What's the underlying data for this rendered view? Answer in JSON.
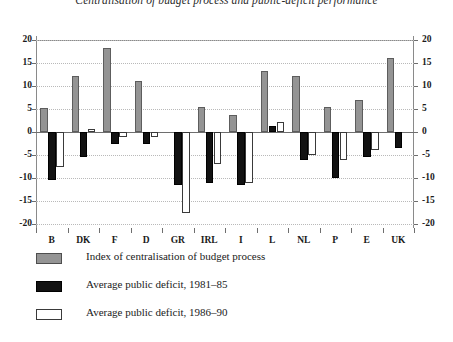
{
  "chart_data": {
    "type": "bar",
    "title": "Centralisation of budget process and public-deficit performance",
    "xlabel": "",
    "ylabel": "",
    "ylim": [
      -20,
      20
    ],
    "yticks": [
      20,
      15,
      10,
      5,
      0,
      -5,
      -10,
      -15,
      -20
    ],
    "ytick_labels": [
      "20",
      "15",
      "10",
      "5",
      "0",
      "-5",
      "-10",
      "-15",
      "-20"
    ],
    "grid": true,
    "dual_y_axis": true,
    "legend_position": "below",
    "categories": [
      "B",
      "DK",
      "F",
      "D",
      "GR",
      "IRL",
      "I",
      "L",
      "NL",
      "P",
      "E",
      "UK"
    ],
    "series": [
      {
        "name": "Index of centralisation of budget process",
        "color": "#949494",
        "values": [
          5.2,
          12.1,
          18.3,
          11.0,
          0.0,
          5.5,
          3.6,
          13.2,
          12.1,
          5.5,
          7.0,
          16.0
        ]
      },
      {
        "name": "Average public deficit, 1981–85",
        "color": "#121212",
        "values": [
          -10.5,
          -5.4,
          -2.6,
          -2.6,
          -11.5,
          -11.0,
          -11.6,
          1.2,
          -6.0,
          -10.0,
          -5.5,
          -3.5
        ]
      },
      {
        "name": "Average public deficit, 1986–90",
        "color": "#ffffff",
        "values": [
          -7.6,
          0.6,
          -1.0,
          -1.0,
          -17.5,
          -7.0,
          -11.0,
          2.2,
          -5.0,
          -6.0,
          -4.0,
          0.0
        ]
      }
    ]
  },
  "axis": {
    "left_labels": [
      "20",
      "15",
      "10",
      "5",
      "0",
      "-5",
      "-10",
      "-15",
      "-20"
    ],
    "right_labels": [
      "20",
      "15",
      "10",
      "5",
      "0",
      "-5",
      "-10",
      "-15",
      "-20"
    ]
  },
  "legend": {
    "items": [
      {
        "swatch": "gray",
        "label": "Index of centralisation of budget process"
      },
      {
        "swatch": "black",
        "label": "Average public deficit, 1981–85"
      },
      {
        "swatch": "white",
        "label": "Average public deficit, 1986–90"
      }
    ]
  }
}
